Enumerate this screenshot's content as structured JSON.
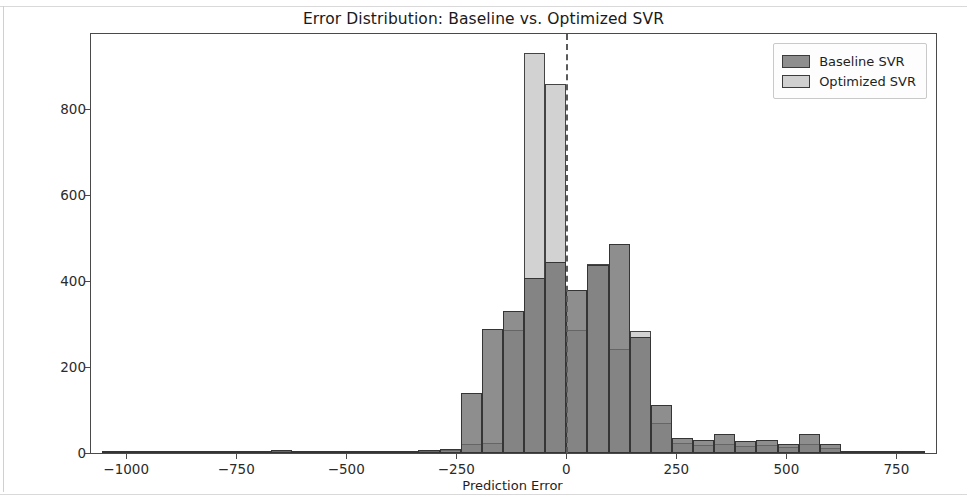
{
  "chart_data": {
    "type": "bar",
    "subtype": "histogram-overlay",
    "title": "Error Distribution: Baseline vs. Optimized SVR",
    "xlabel": "Prediction Error",
    "ylabel": "Frequency",
    "xlim": [
      -1080,
      840
    ],
    "ylim": [
      0,
      975
    ],
    "xticks": [
      -1000,
      -750,
      -500,
      -250,
      0,
      250,
      500,
      750
    ],
    "xtick_labels": [
      "−1000",
      "−750",
      "−500",
      "−250",
      "0",
      "250",
      "500",
      "750"
    ],
    "yticks": [
      0,
      200,
      400,
      600,
      800
    ],
    "ytick_labels": [
      "0",
      "200",
      "400",
      "600",
      "800"
    ],
    "grid": false,
    "legend_position": "upper right",
    "bin_width": 48,
    "annotations": [
      {
        "name": "zero-reference-line",
        "type": "vline",
        "x": 0,
        "style": "dashed",
        "color": "#5a5a5a"
      }
    ],
    "colors": {
      "baseline": "#6e6e6e",
      "optimized": "#c8c8c8",
      "edge": "#3b3b3b",
      "axis": "#4a4a4a",
      "text": "#1f1f1f"
    },
    "series": [
      {
        "name": "Baseline SVR",
        "bin_centers": [
          -1032,
          -984,
          -936,
          -888,
          -840,
          -792,
          -744,
          -696,
          -648,
          -600,
          -552,
          -504,
          -456,
          -408,
          -360,
          -312,
          -264,
          -216,
          -168,
          -120,
          -72,
          -24,
          24,
          72,
          120,
          168,
          216,
          264,
          312,
          360,
          408,
          456,
          504,
          552,
          600,
          648,
          696,
          744,
          792
        ],
        "values": [
          2,
          3,
          2,
          2,
          1,
          2,
          2,
          3,
          8,
          4,
          3,
          3,
          2,
          4,
          5,
          6,
          9,
          140,
          288,
          330,
          408,
          444,
          380,
          438,
          486,
          270,
          111,
          36,
          30,
          44,
          28,
          30,
          22,
          44,
          20,
          3,
          2,
          5,
          4
        ]
      },
      {
        "name": "Optimized SVR",
        "bin_centers": [
          -1032,
          -984,
          -936,
          -888,
          -840,
          -792,
          -744,
          -696,
          -648,
          -600,
          -552,
          -504,
          -456,
          -408,
          -360,
          -312,
          -264,
          -216,
          -168,
          -120,
          -72,
          -24,
          24,
          72,
          120,
          168,
          216,
          264,
          312,
          360,
          408,
          456,
          504,
          552,
          600,
          648,
          696,
          744,
          792
        ],
        "values": [
          1,
          1,
          1,
          1,
          1,
          1,
          1,
          1,
          2,
          1,
          1,
          1,
          1,
          1,
          2,
          2,
          6,
          20,
          24,
          286,
          930,
          858,
          286,
          440,
          242,
          285,
          70,
          24,
          18,
          22,
          16,
          18,
          14,
          22,
          12,
          2,
          1,
          2,
          2
        ]
      }
    ]
  },
  "legend": {
    "items": [
      {
        "label": "Baseline SVR",
        "key": "baseline"
      },
      {
        "label": "Optimized SVR",
        "key": "optimized"
      }
    ]
  }
}
